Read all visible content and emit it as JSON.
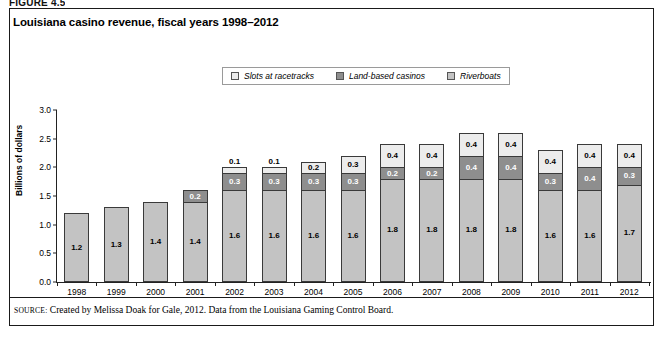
{
  "figure": {
    "label": "FIGURE 4.5"
  },
  "chart_title": "Louisiana casino revenue, fiscal years 1998–2012",
  "legend": {
    "items": [
      {
        "label": "Slots at racetracks",
        "color": "#ececec"
      },
      {
        "label": "Land-based casinos",
        "color": "#8e8e8e"
      },
      {
        "label": "Riverboats",
        "color": "#c3c3c3"
      }
    ]
  },
  "source": {
    "prefix": "Source:",
    "text": "Created by Melissa Doak for Gale, 2012. Data from the Louisiana Gaming Control Board."
  },
  "chart_data": {
    "type": "bar",
    "subtype": "stacked",
    "title": "Louisiana casino revenue, fiscal years 1998–2012",
    "xlabel": "",
    "ylabel": "Billions of dollars",
    "ylim": [
      0.0,
      3.0
    ],
    "yticks": [
      "0.0",
      "0.5",
      "1.0",
      "1.5",
      "2.0",
      "2.5",
      "3.0"
    ],
    "ytick_values": [
      0.0,
      0.5,
      1.0,
      1.5,
      2.0,
      2.5,
      3.0
    ],
    "grid": false,
    "legend_position": "top-center",
    "categories": [
      "1998",
      "1999",
      "2000",
      "2001",
      "2002",
      "2003",
      "2004",
      "2005",
      "2006",
      "2007",
      "2008",
      "2009",
      "2010",
      "2011",
      "2012"
    ],
    "series": [
      {
        "name": "Riverboats",
        "color": "#c3c3c3",
        "values": [
          1.2,
          1.3,
          1.4,
          1.4,
          1.6,
          1.6,
          1.6,
          1.6,
          1.8,
          1.8,
          1.8,
          1.8,
          1.6,
          1.6,
          1.7
        ],
        "labels": [
          "1.2",
          "1.3",
          "1.4",
          "1.4",
          "1.6",
          "1.6",
          "1.6",
          "1.6",
          "1.8",
          "1.8",
          "1.8",
          "1.8",
          "1.6",
          "1.6",
          "1.7"
        ]
      },
      {
        "name": "Land-based casinos",
        "color": "#8e8e8e",
        "values": [
          0,
          0,
          0,
          0.2,
          0.3,
          0.3,
          0.3,
          0.3,
          0.2,
          0.2,
          0.4,
          0.4,
          0.3,
          0.4,
          0.3
        ],
        "labels": [
          "",
          "",
          "",
          "0.2",
          "0.3",
          "0.3",
          "0.3",
          "0.3",
          "0.2",
          "0.2",
          "0.4",
          "0.4",
          "0.3",
          "0.4",
          "0.3"
        ]
      },
      {
        "name": "Slots at racetracks",
        "color": "#ececec",
        "values": [
          0,
          0,
          0,
          0,
          0.1,
          0.1,
          0.2,
          0.3,
          0.4,
          0.4,
          0.4,
          0.4,
          0.4,
          0.4,
          0.4
        ],
        "labels": [
          "",
          "",
          "",
          "",
          "0.1",
          "0.1",
          "0.2",
          "0.3",
          "0.4",
          "0.4",
          "0.4",
          "0.4",
          "0.4",
          "0.4",
          "0.4"
        ]
      }
    ],
    "totals": [
      1.2,
      1.3,
      1.4,
      1.6,
      2.0,
      2.0,
      2.1,
      2.2,
      2.4,
      2.4,
      2.6,
      2.6,
      2.3,
      2.4,
      2.4
    ]
  }
}
